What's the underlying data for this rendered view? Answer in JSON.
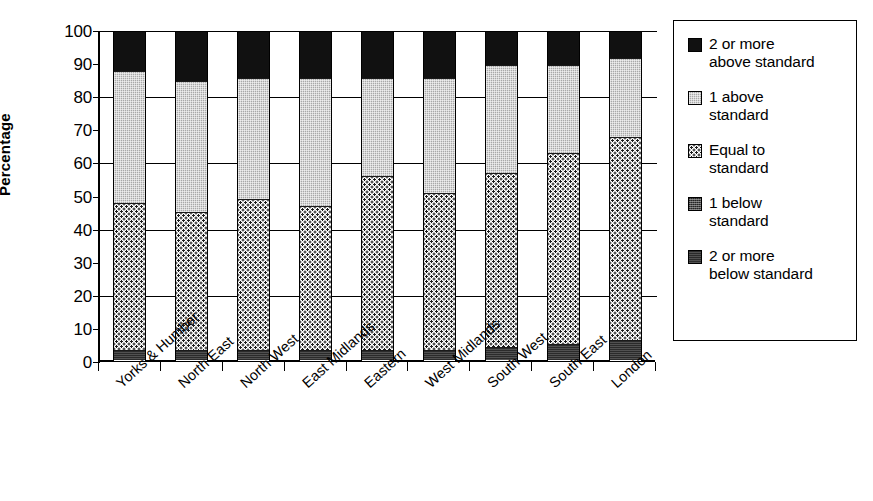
{
  "chart_data": {
    "type": "bar",
    "subtype": "stacked-bar-100",
    "title": "",
    "xlabel": "",
    "ylabel": "Percentage",
    "ylim": [
      0,
      100
    ],
    "yticks": [
      100,
      90,
      80,
      70,
      60,
      50,
      40,
      30,
      20,
      10,
      0
    ],
    "gridlines_at": [
      100,
      80,
      60,
      40,
      20
    ],
    "grid": true,
    "legend_position": "right",
    "categories": [
      "Yorks & Humber",
      "North East",
      "North West",
      "East Midlands",
      "Eastern",
      "West Midlands",
      "South West",
      "South East",
      "London"
    ],
    "series": [
      {
        "name": "2 or more below standard",
        "legend_label_line1": "2 or more",
        "legend_label_line2": "below standard",
        "swatch": "solid-dark",
        "color": "#2b2b2b",
        "values": [
          3,
          3,
          3,
          3,
          3,
          3,
          4,
          5,
          6
        ]
      },
      {
        "name": "1 below standard",
        "legend_label_line1": "1 below",
        "legend_label_line2": "standard",
        "swatch": "dark-checker",
        "color": "#4a4a4a",
        "values": [
          0,
          0,
          0,
          0,
          0,
          0,
          0,
          0,
          0
        ]
      },
      {
        "name": "Equal to standard",
        "legend_label_line1": "Equal to",
        "legend_label_line2": "standard",
        "swatch": "fine-stipple",
        "color": "#ffffff",
        "values": [
          45,
          42,
          46,
          44,
          53,
          48,
          53,
          58,
          62
        ]
      },
      {
        "name": "1 above standard",
        "legend_label_line1": "1 above",
        "legend_label_line2": "standard",
        "swatch": "light-gray",
        "color": "#a8a8a8",
        "values": [
          40,
          40,
          37,
          39,
          30,
          35,
          33,
          27,
          24
        ]
      },
      {
        "name": "2 or more above standard",
        "legend_label_line1": "2 or more",
        "legend_label_line2": "above standard",
        "swatch": "solid-black",
        "color": "#111111",
        "values": [
          12,
          15,
          14,
          14,
          14,
          14,
          10,
          10,
          8
        ]
      }
    ],
    "stack_order_bottom_to_top": [
      "2 or more below standard",
      "1 below standard",
      "Equal to standard",
      "1 above standard",
      "2 or more above standard"
    ]
  },
  "axis": {
    "y_title": "Percentage"
  }
}
